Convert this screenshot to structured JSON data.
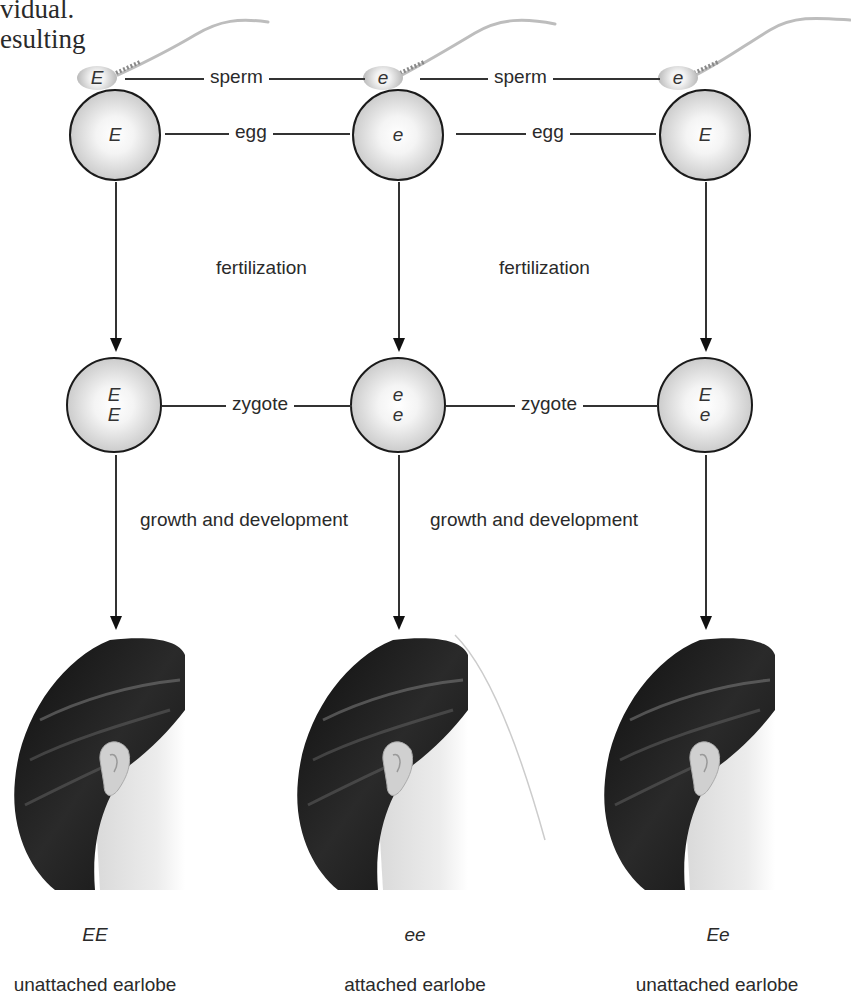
{
  "header_text": {
    "line1": "vidual.",
    "line2": "esulting"
  },
  "columns": [
    {
      "sperm_allele": "E",
      "egg_allele": "E",
      "zygote_alleles": [
        "E",
        "E"
      ],
      "genotype": "EE",
      "phenotype": "unattached earlobe"
    },
    {
      "sperm_allele": "e",
      "egg_allele": "e",
      "zygote_alleles": [
        "e",
        "e"
      ],
      "genotype": "ee",
      "phenotype": "attached earlobe"
    },
    {
      "sperm_allele": "e",
      "egg_allele": "E",
      "zygote_alleles": [
        "E",
        "e"
      ],
      "genotype": "Ee",
      "phenotype": "unattached earlobe"
    }
  ],
  "labels": {
    "sperm": "sperm",
    "egg": "egg",
    "fertilization": "fertilization",
    "zygote": "zygote",
    "growth": "growth and development"
  },
  "icons": {
    "sperm": "sperm-illustration",
    "egg": "egg-cell-circle",
    "zygote": "zygote-cell-circle",
    "arrow": "down-arrow",
    "head": "head-with-ear-illustration"
  },
  "colors": {
    "line": "#333333",
    "cell_border": "#1a1a1a",
    "hair": "#151515",
    "skin": "#e6e6e6"
  }
}
